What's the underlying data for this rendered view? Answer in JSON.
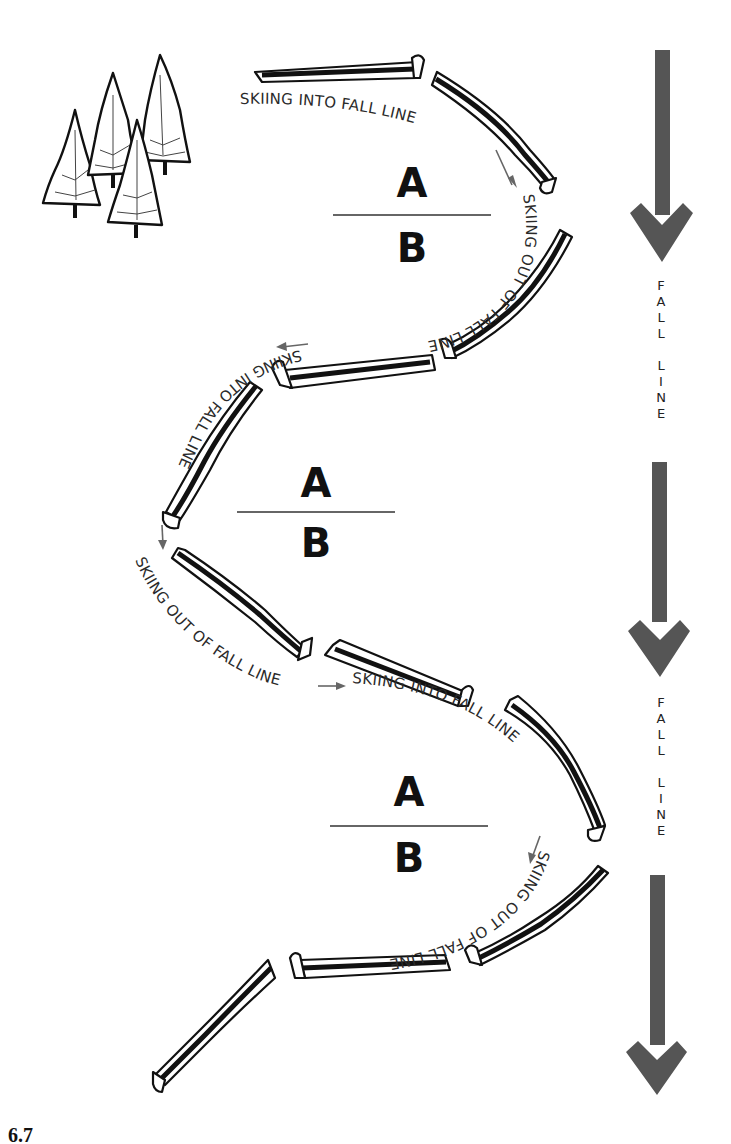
{
  "figure": {
    "labels": {
      "skiing_into": "SKIING INTO FALL LINE",
      "skiing_out": "SKIING OUT OF FALL LINE"
    },
    "fractions": [
      {
        "numerator": "A",
        "denominator": "B"
      },
      {
        "numerator": "A",
        "denominator": "B"
      },
      {
        "numerator": "A",
        "denominator": "B"
      }
    ],
    "fall_line_labels": [
      {
        "word1": "FALL",
        "word2": "LINE"
      },
      {
        "word1": "FALL",
        "word2": "LINE"
      }
    ],
    "colors": {
      "arrow": "#555555",
      "ink": "#111111",
      "pointer": "#666666",
      "background": "#ffffff"
    },
    "icons": [
      "pine-trees-icon",
      "down-arrow-icon",
      "ski-icon"
    ],
    "caption_partial": "6.7"
  }
}
